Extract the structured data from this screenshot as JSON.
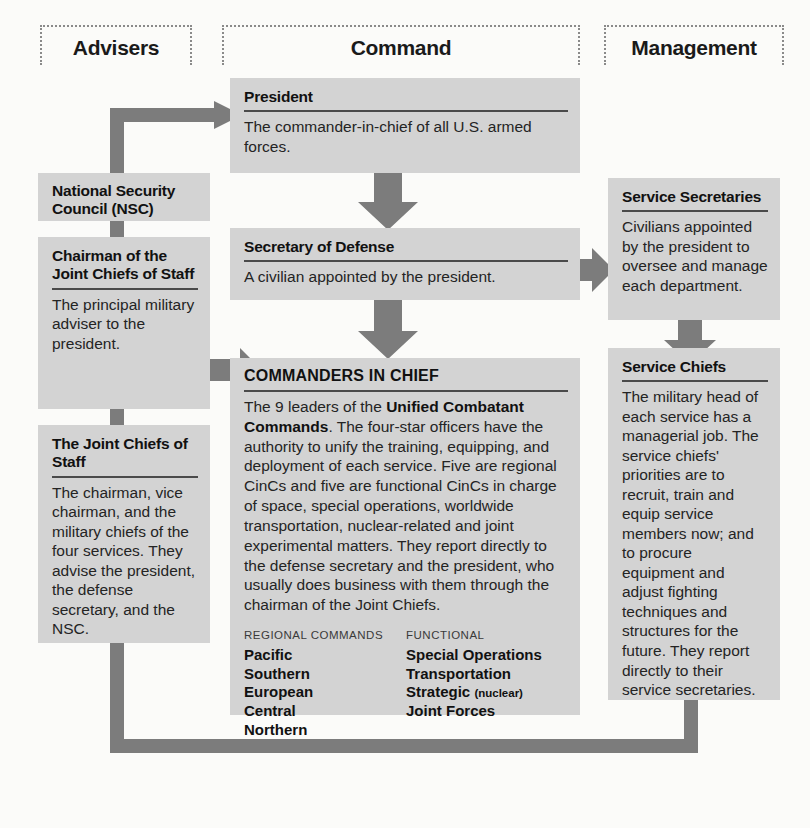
{
  "columns": [
    {
      "label": "Advisers"
    },
    {
      "label": "Command"
    },
    {
      "label": "Management"
    }
  ],
  "boxes": {
    "president": {
      "title": "President",
      "body": "The commander-in-chief of all U.S. armed forces."
    },
    "nsc": {
      "title": "National Security Council (NSC)"
    },
    "chairman": {
      "title": "Chairman of the Joint Chiefs of Staff",
      "body": "The principal military adviser to the president."
    },
    "joint_chiefs": {
      "title": "The Joint Chiefs of Staff",
      "body": "The chairman, vice chairman, and the military chiefs of the four services. They advise the president, the defense secretary, and the NSC."
    },
    "secdef": {
      "title": "Secretary of Defense",
      "body": "A civilian appointed by the president."
    },
    "cinc": {
      "title": "COMMANDERS IN CHIEF",
      "body_part1": "The 9 leaders of the ",
      "body_bold": "Unified Combatant Commands",
      "body_part2": ". The four-star officers have the authority to unify the training, equipping, and deployment of each service. Five are regional CinCs and five are functional CinCs in charge of space, special operations, worldwide transportation, nuclear-related and joint experimental matters. They report directly to the defense secretary and the president, who usually does business with them through the chairman of the Joint Chiefs.",
      "regional_heading": "REGIONAL COMMANDS",
      "regional_items": [
        "Pacific",
        "Southern",
        "European",
        "Central",
        "Northern"
      ],
      "functional_heading": "FUNCTIONAL",
      "functional_items": [
        "Special Operations",
        "Transportation",
        "Joint Forces"
      ],
      "functional_strategic": "Strategic",
      "functional_strategic_qualifier": "(nuclear)"
    },
    "service_secretaries": {
      "title": "Service Secretaries",
      "body": "Civilians appointed by the president to oversee and manage each department."
    },
    "service_chiefs": {
      "title": "Service Chiefs",
      "body": "The military head of each service has a managerial job. The service chiefs' priorities are to recruit, train and equip service members now; and to procure equipment and adjust fighting techniques and structures for the future. They report directly to their service secretaries."
    }
  },
  "colors": {
    "box_fill": "#d3d3d3",
    "connector": "#7c7c7c",
    "header_border": "#8a8a8a",
    "page_background": "#fbfbf9",
    "text": "#242424"
  }
}
